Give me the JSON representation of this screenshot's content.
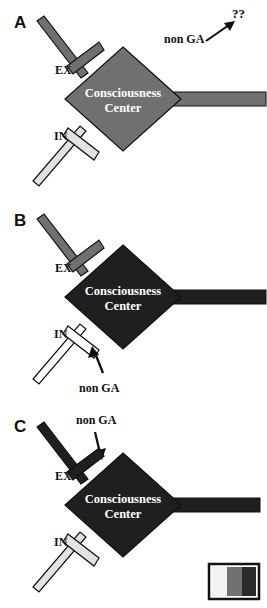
{
  "figure": {
    "background": "#ffffff",
    "width": 267,
    "height": 608
  },
  "colors": {
    "light_gray": "#e2e2e2",
    "medium_gray": "#707070",
    "dark_gray": "#1f1f1f",
    "black": "#111111",
    "white": "#ffffff",
    "outline": "#111111"
  },
  "panels": [
    {
      "id": "A",
      "letter": "A",
      "center_line1": "Consciousness",
      "center_line2": "Center",
      "center_fill": "#707070",
      "excitatory": {
        "label": "EX",
        "fill": "#707070"
      },
      "inhibitory": {
        "label": "IN",
        "fill": "#e2e2e2"
      },
      "output": {
        "fill": "#707070"
      },
      "annotation": {
        "label": "non GA",
        "target": "??",
        "direction": "up-right"
      }
    },
    {
      "id": "B",
      "letter": "B",
      "center_line1": "Consciousness",
      "center_line2": "Center",
      "center_fill": "#1f1f1f",
      "excitatory": {
        "label": "EX",
        "fill": "#707070"
      },
      "inhibitory": {
        "label": "IN",
        "fill": "#ffffff"
      },
      "output": {
        "fill": "#1f1f1f"
      },
      "annotation": {
        "label": "non GA",
        "target": "IN",
        "direction": "up"
      }
    },
    {
      "id": "C",
      "letter": "C",
      "center_line1": "Consciousness",
      "center_line2": "Center",
      "center_fill": "#1f1f1f",
      "excitatory": {
        "label": "EX",
        "fill": "#1f1f1f"
      },
      "inhibitory": {
        "label": "IN",
        "fill": "#e2e2e2"
      },
      "output": {
        "fill": "#1f1f1f"
      },
      "annotation": {
        "label": "non GA",
        "target": "EX",
        "direction": "down-right"
      }
    }
  ],
  "legend": {
    "bands": [
      {
        "name": "light",
        "color": "#f2f2f2"
      },
      {
        "name": "medium",
        "color": "#707070"
      },
      {
        "name": "dark",
        "color": "#2a2a2a"
      }
    ],
    "border": "#111111"
  }
}
